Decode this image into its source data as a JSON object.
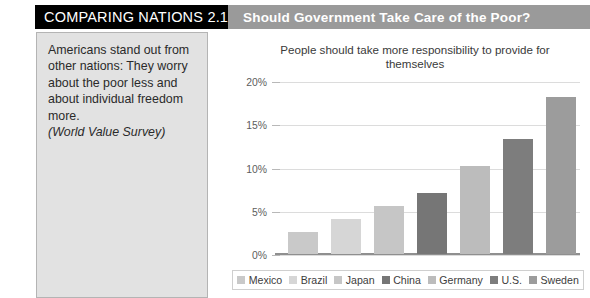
{
  "header": {
    "badge_label": "COMPARING NATIONS 2.1",
    "title": "Should Government Take Care of the Poor?",
    "badge_bg": "#000000",
    "badge_fg": "#ffffff",
    "title_bg": "#9a9a9a",
    "title_fg": "#ffffff"
  },
  "caption": {
    "body": "Americans stand out from other nations: They worry about the poor less and about individual freedom more.",
    "source": "(World Value Survey)",
    "panel_bg": "#e2e2e2",
    "panel_border": "#b4b4b4"
  },
  "chart_data": {
    "type": "bar",
    "title": "People should take more responsibility to provide for themselves",
    "xlabel": "",
    "ylabel": "",
    "categories": [
      "Mexico",
      "Brazil",
      "Japan",
      "China",
      "Germany",
      "U.S.",
      "Sweden"
    ],
    "values": [
      2.5,
      4.0,
      5.5,
      7.0,
      10.2,
      13.3,
      18.2
    ],
    "value_suffix": "%",
    "ylim": [
      0,
      20
    ],
    "yticks": [
      0,
      5,
      10,
      15,
      20
    ],
    "ytick_labels": [
      "0%",
      "5%",
      "10%",
      "15%",
      "20%"
    ],
    "grid": true,
    "legend_position": "bottom",
    "bar_colors": [
      "#c9c9c9",
      "#d6d6d6",
      "#c6c6c6",
      "#767676",
      "#bcbcbc",
      "#7d7d7d",
      "#9c9c9c"
    ]
  }
}
